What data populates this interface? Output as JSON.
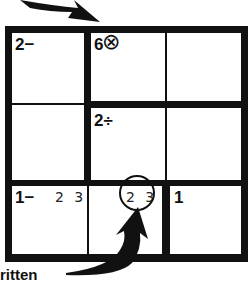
{
  "puzzle": {
    "size": 3,
    "cages": [
      {
        "clue": "2−",
        "cell": "r1c1"
      },
      {
        "clue": "6",
        "cell": "r1c2",
        "mark": "⊗"
      },
      {
        "clue": "2÷",
        "cell": "r2c2"
      },
      {
        "clue": "1−",
        "cell": "r3c1"
      },
      {
        "clue": "1",
        "cell": "r3c3"
      }
    ],
    "candidates": {
      "r3c1": "2 3",
      "r3c2": "2 3"
    }
  },
  "annotation": {
    "caption_fragment": "ritten"
  },
  "colors": {
    "ink": "#111111",
    "background": "#ffffff"
  }
}
